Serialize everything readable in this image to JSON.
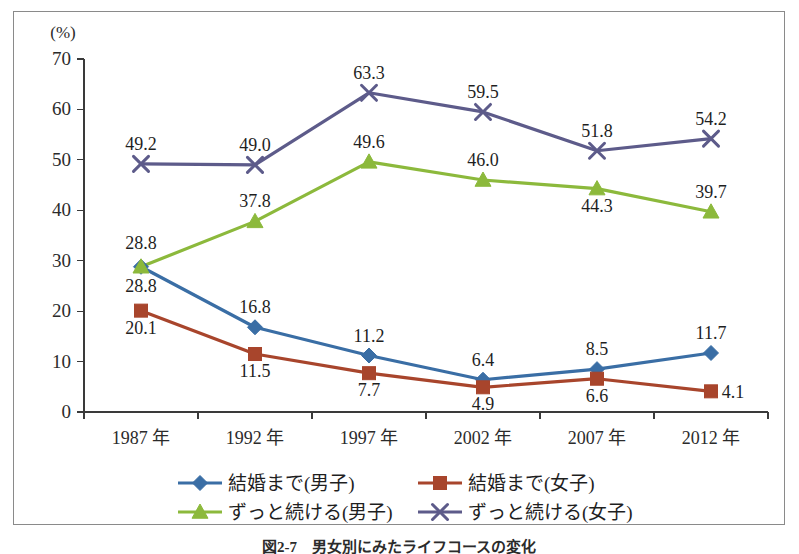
{
  "figure": {
    "unit_label": "(%)",
    "caption": "図2-7　男女別にみたライフコースの変化"
  },
  "chart_data": {
    "type": "line",
    "title": "",
    "xlabel": "",
    "ylabel": "(%)",
    "categories": [
      "1987 年",
      "1992 年",
      "1997 年",
      "2002 年",
      "2007 年",
      "2012 年"
    ],
    "ylim": [
      0,
      70
    ],
    "ytick_step": 10,
    "yticks": [
      "0",
      "10",
      "20",
      "30",
      "40",
      "50",
      "60",
      "70"
    ],
    "grid": false,
    "legend_position": "bottom",
    "series": [
      {
        "name": "結婚まで(男子)",
        "color": "#3a6ea5",
        "marker": "diamond",
        "values": [
          28.8,
          16.8,
          11.2,
          6.4,
          8.5,
          11.7
        ],
        "label_positions": [
          "above",
          "above",
          "above",
          "above",
          "above",
          "above"
        ]
      },
      {
        "name": "結婚まで(女子)",
        "color": "#a8452c",
        "marker": "square",
        "values": [
          20.1,
          11.5,
          7.7,
          4.9,
          6.6,
          4.1
        ],
        "label_positions": [
          "below",
          "below",
          "below",
          "below",
          "below",
          "right"
        ]
      },
      {
        "name": "ずっと続ける(男子)",
        "color": "#8cb93c",
        "marker": "triangle",
        "values": [
          28.8,
          37.8,
          49.6,
          46.0,
          44.3,
          39.7
        ],
        "label_positions": [
          "above",
          "above",
          "above",
          "above",
          "below",
          "above"
        ]
      },
      {
        "name": "ずっと続ける(女子)",
        "color": "#5d5b8a",
        "marker": "cross",
        "values": [
          49.2,
          49.0,
          63.3,
          59.5,
          51.8,
          54.2
        ],
        "label_positions": [
          "above",
          "above",
          "above",
          "above",
          "above",
          "above"
        ]
      }
    ]
  }
}
